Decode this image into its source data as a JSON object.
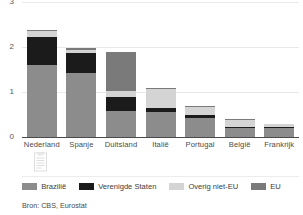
{
  "chart_data": {
    "type": "bar",
    "stacked": true,
    "title": "",
    "subtitle": "",
    "xlabel": "",
    "ylabel": "",
    "categories": [
      "Nederland",
      "Spanje",
      "Duitsland",
      "Italië",
      "Portugal",
      "België",
      "Frankrijk"
    ],
    "series": [
      {
        "name": "Brazilië",
        "color": "#8c8c8c",
        "values": [
          1.6,
          1.43,
          0.59,
          0.56,
          0.43,
          0.2,
          0.2
        ]
      },
      {
        "name": "Verenigde Staten",
        "color": "#1b1b1b",
        "values": [
          0.62,
          0.45,
          0.29,
          0.09,
          0.07,
          0.02,
          0.03
        ]
      },
      {
        "name": "Overig niet-EU",
        "color": "#d4d4d4",
        "values": [
          0.13,
          0.05,
          0.15,
          0.43,
          0.17,
          0.17,
          0.05
        ]
      },
      {
        "name": "EU",
        "color": "#7a7a7a",
        "values": [
          0.03,
          0.05,
          0.86,
          0.01,
          0.02,
          0.01,
          0.01
        ]
      }
    ],
    "yticks": [
      0,
      1,
      2,
      3
    ],
    "ytick_labels": [
      "0",
      "1",
      "2",
      "3"
    ],
    "ylim": [
      0,
      3.05
    ],
    "grid": true,
    "legend_position": "bottom",
    "totals": [
      2.38,
      1.98,
      1.89,
      1.09,
      0.69,
      0.4,
      0.29
    ]
  },
  "legend": {
    "items": [
      {
        "label": "Brazilië",
        "color": "#8c8c8c",
        "icon": "legend-swatch-icon"
      },
      {
        "label": "Verenigde Staten",
        "color": "#1b1b1b",
        "icon": "legend-swatch-icon"
      },
      {
        "label": "Overig niet-EU",
        "color": "#d4d4d4",
        "icon": "legend-swatch-icon"
      },
      {
        "label": "EU",
        "color": "#7a7a7a",
        "icon": "legend-swatch-icon"
      }
    ]
  },
  "footer": {
    "source": "Bron: CBS, Eurostat"
  },
  "watermark": {
    "icon": "document-watermark-icon"
  },
  "colors": {
    "axis": "#4a4a4a",
    "grid": "#e9e9e9",
    "text": "#3c3c3c",
    "background": "#ffffff"
  }
}
